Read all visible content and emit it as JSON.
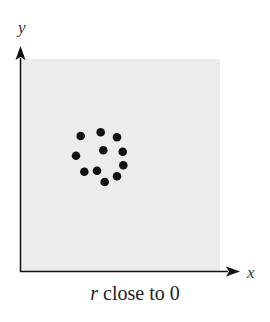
{
  "chart_data": {
    "type": "scatter",
    "title": "",
    "caption_var": "r",
    "caption_rest": " close to 0",
    "xlabel": "x",
    "ylabel": "y",
    "grid": false,
    "legend": null,
    "plot_background": "#ececec",
    "point_color": "#111111",
    "points_px": [
      [
        80.7,
        136
      ],
      [
        100.7,
        132.3
      ],
      [
        117,
        137.3
      ],
      [
        76,
        155.7
      ],
      [
        103.3,
        150.3
      ],
      [
        122.7,
        151.7
      ],
      [
        123.3,
        165.3
      ],
      [
        84.3,
        171.7
      ],
      [
        97,
        170.7
      ],
      [
        117,
        176.3
      ],
      [
        104.7,
        182
      ]
    ],
    "note": "No tick labels; points arranged roughly in a ring indicating correlation near zero"
  }
}
